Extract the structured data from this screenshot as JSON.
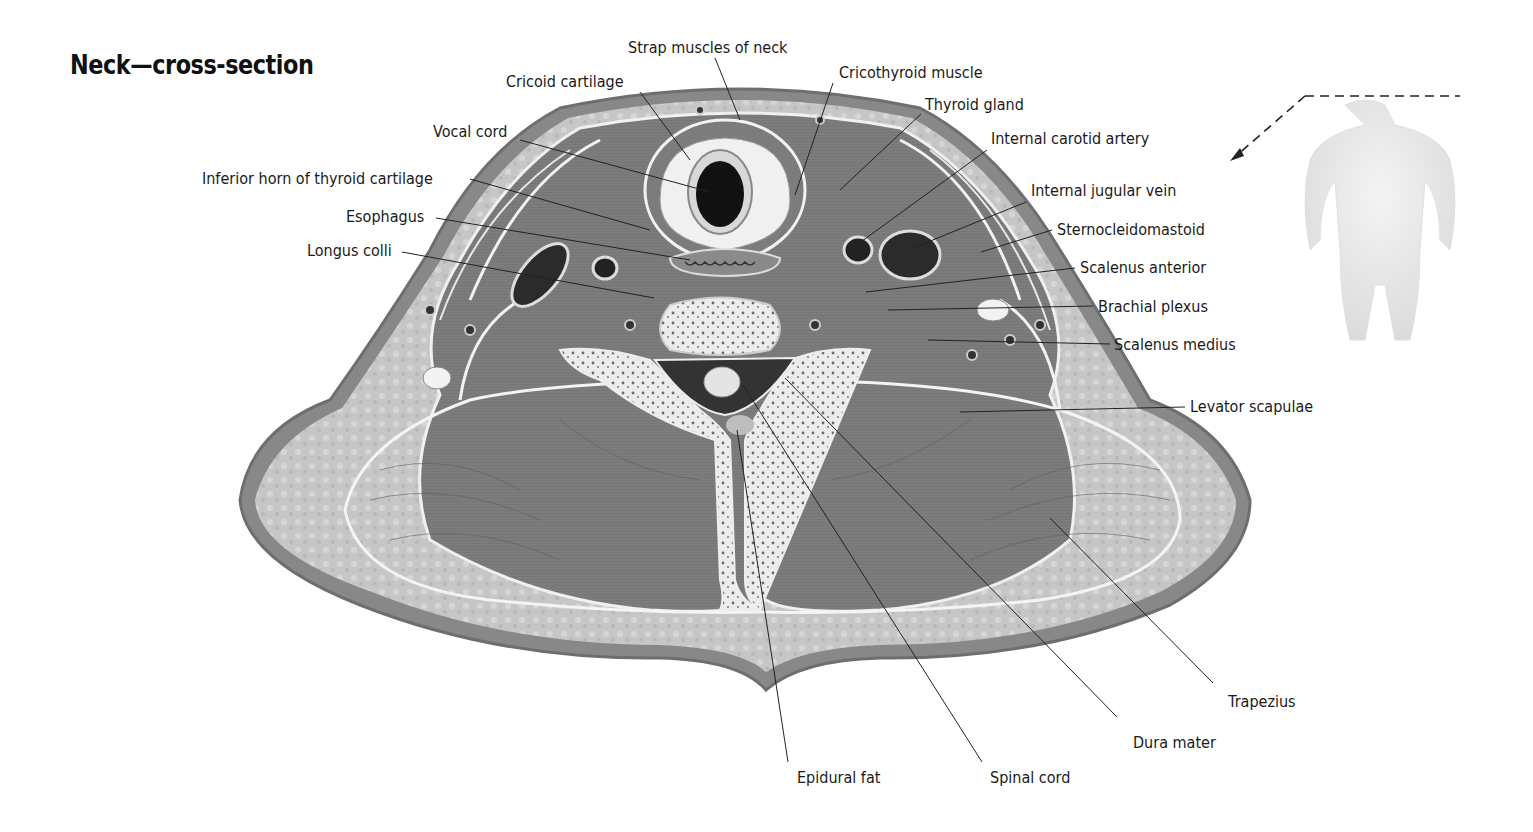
{
  "title": "Neck—cross-section",
  "colors": {
    "skin": "#8a8a8a",
    "fat": "#c9c9c9",
    "muscle": "#7d7d7d",
    "fascia": "#eeeeee",
    "bone": "#e6e6e6",
    "vessel": "#2a2a2a",
    "leader": "#222222",
    "body_silhouette": "#ececec"
  },
  "locator": {
    "description": "body-silhouette-with-dashed-neck-level-indicator"
  },
  "labels": [
    {
      "id": "strap-muscles",
      "text": "Strap muscles of neck",
      "x": 628,
      "y": 39,
      "anchor": "left",
      "line": [
        [
          715,
          58
        ],
        [
          740,
          120
        ]
      ]
    },
    {
      "id": "cricoid-cartilage",
      "text": "Cricoid cartilage",
      "x": 506,
      "y": 73,
      "anchor": "left",
      "line": [
        [
          640,
          92
        ],
        [
          690,
          160
        ]
      ]
    },
    {
      "id": "cricothyroid-muscle",
      "text": "Cricothyroid muscle",
      "x": 839,
      "y": 64,
      "anchor": "left",
      "line": [
        [
          833,
          83
        ],
        [
          795,
          195
        ]
      ]
    },
    {
      "id": "thyroid-gland",
      "text": "Thyroid gland",
      "x": 925,
      "y": 96,
      "anchor": "left",
      "line": [
        [
          921,
          114
        ],
        [
          840,
          190
        ]
      ]
    },
    {
      "id": "vocal-cord",
      "text": "Vocal cord",
      "x": 433,
      "y": 123,
      "anchor": "left",
      "line": [
        [
          520,
          140
        ],
        [
          710,
          192
        ]
      ]
    },
    {
      "id": "internal-carotid-artery",
      "text": "Internal carotid artery",
      "x": 991,
      "y": 130,
      "anchor": "left",
      "line": [
        [
          987,
          150
        ],
        [
          858,
          244
        ]
      ]
    },
    {
      "id": "inferior-horn-thyroid",
      "text": "Inferior horn of thyroid cartilage",
      "x": 202,
      "y": 170,
      "anchor": "left",
      "line": [
        [
          470,
          179
        ],
        [
          650,
          230
        ]
      ]
    },
    {
      "id": "internal-jugular-vein",
      "text": "Internal jugular vein",
      "x": 1031,
      "y": 182,
      "anchor": "left",
      "line": [
        [
          1026,
          202
        ],
        [
          913,
          248
        ]
      ]
    },
    {
      "id": "esophagus",
      "text": "Esophagus",
      "x": 346,
      "y": 208,
      "anchor": "left",
      "line": [
        [
          436,
          218
        ],
        [
          690,
          260
        ]
      ]
    },
    {
      "id": "sternocleidomastoid",
      "text": "Sternocleidomastoid",
      "x": 1057,
      "y": 221,
      "anchor": "left",
      "line": [
        [
          1052,
          230
        ],
        [
          981,
          252
        ]
      ]
    },
    {
      "id": "longus-colli",
      "text": "Longus colli",
      "x": 307,
      "y": 242,
      "anchor": "left",
      "line": [
        [
          402,
          252
        ],
        [
          654,
          298
        ]
      ]
    },
    {
      "id": "scalenus-anterior",
      "text": "Scalenus anterior",
      "x": 1080,
      "y": 259,
      "anchor": "left",
      "line": [
        [
          1075,
          268
        ],
        [
          866,
          292
        ]
      ]
    },
    {
      "id": "brachial-plexus",
      "text": "Brachial plexus",
      "x": 1098,
      "y": 298,
      "anchor": "left",
      "line": [
        [
          1093,
          306
        ],
        [
          888,
          310
        ]
      ]
    },
    {
      "id": "scalenus-medius",
      "text": "Scalenus medius",
      "x": 1114,
      "y": 336,
      "anchor": "left",
      "line": [
        [
          1110,
          344
        ],
        [
          928,
          340
        ]
      ]
    },
    {
      "id": "levator-scapulae",
      "text": "Levator scapulae",
      "x": 1190,
      "y": 398,
      "anchor": "left",
      "line": [
        [
          1185,
          407
        ],
        [
          960,
          412
        ]
      ]
    },
    {
      "id": "trapezius",
      "text": "Trapezius",
      "x": 1228,
      "y": 693,
      "anchor": "left",
      "line": [
        [
          1213,
          683
        ],
        [
          1050,
          518
        ]
      ]
    },
    {
      "id": "dura-mater",
      "text": "Dura mater",
      "x": 1133,
      "y": 734,
      "anchor": "left",
      "line": [
        [
          1117,
          717
        ],
        [
          785,
          378
        ]
      ]
    },
    {
      "id": "epidural-fat",
      "text": "Epidural fat",
      "x": 797,
      "y": 769,
      "anchor": "left",
      "line": [
        [
          788,
          762
        ],
        [
          737,
          430
        ]
      ]
    },
    {
      "id": "spinal-cord",
      "text": "Spinal cord",
      "x": 990,
      "y": 769,
      "anchor": "left",
      "line": [
        [
          982,
          762
        ],
        [
          743,
          385
        ]
      ]
    }
  ]
}
